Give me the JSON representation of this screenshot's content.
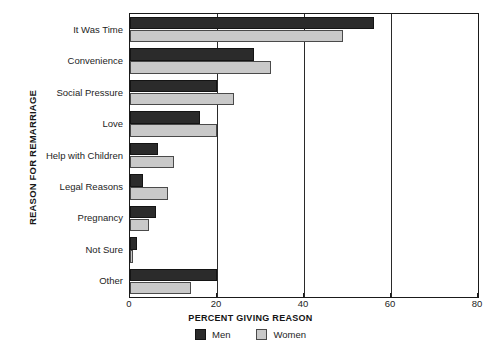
{
  "chart_data": {
    "type": "bar",
    "orientation": "horizontal",
    "title": "",
    "xlabel": "PERCENT GIVING REASON",
    "ylabel": "REASON FOR REMARRIAGE",
    "categories": [
      "It Was Time",
      "Convenience",
      "Social Pressure",
      "Love",
      "Help with Children",
      "Legal Reasons",
      "Pregnancy",
      "Not Sure",
      "Other"
    ],
    "series": [
      {
        "name": "Men",
        "color": "#2b2b2b",
        "values": [
          56,
          28.5,
          20,
          16,
          6.5,
          3,
          6,
          1.7,
          20
        ]
      },
      {
        "name": "Women",
        "color": "#c9c9c9",
        "values": [
          49,
          32.5,
          24,
          20,
          10,
          8.7,
          4.4,
          0.6,
          14
        ]
      }
    ],
    "xlim": [
      0,
      80
    ],
    "xticks": [
      0,
      20,
      40,
      60,
      80
    ],
    "grid": true,
    "gridlines_at": [
      20,
      40,
      60
    ],
    "legend_position": "bottom-center"
  },
  "legend": {
    "items": [
      {
        "label": "Men"
      },
      {
        "label": "Women"
      }
    ]
  }
}
